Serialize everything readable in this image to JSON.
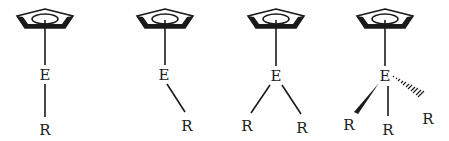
{
  "diagram": {
    "colors": {
      "ink": "#1a1a1a",
      "background": "#ffffff"
    },
    "molecules": [
      {
        "id": "cp-e-r-linear",
        "ring_label": "Cp",
        "center_atom": "E",
        "substituents": [
          {
            "label": "R",
            "bond": "single"
          }
        ]
      },
      {
        "id": "cp-e-r-bent",
        "ring_label": "Cp",
        "center_atom": "E",
        "substituents": [
          {
            "label": "R",
            "bond": "single"
          }
        ]
      },
      {
        "id": "cp-e-r2",
        "ring_label": "Cp",
        "center_atom": "E",
        "substituents": [
          {
            "label": "R",
            "bond": "single"
          },
          {
            "label": "R",
            "bond": "single"
          }
        ]
      },
      {
        "id": "cp-e-r3",
        "ring_label": "Cp",
        "center_atom": "E",
        "substituents": [
          {
            "label": "R",
            "bond": "wedge"
          },
          {
            "label": "R",
            "bond": "single"
          },
          {
            "label": "R",
            "bond": "hash"
          }
        ]
      }
    ]
  }
}
